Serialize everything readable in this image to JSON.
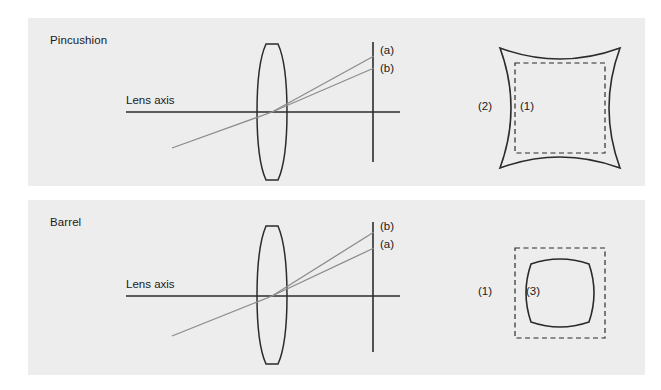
{
  "figure": {
    "background_color": "#ffffff",
    "panel_background_color": "#ededed",
    "line_color": "#2b2b2b",
    "ray_color": "#8c8c8c"
  },
  "panels": [
    {
      "id": "pincushion",
      "title": "Pincushion",
      "axis_label": "Lens axis",
      "ray_labels": {
        "upper": "(a)",
        "lower": "(b)"
      },
      "shape_labels": {
        "outer": "(2)",
        "inner": "(1)"
      },
      "distortion_shape": "concave-sided-square",
      "reference_shape": "dashed-square"
    },
    {
      "id": "barrel",
      "title": "Barrel",
      "axis_label": "Lens axis",
      "ray_labels": {
        "upper": "(b)",
        "lower": "(a)"
      },
      "shape_labels": {
        "outer": "(1)",
        "inner": "(3)"
      },
      "distortion_shape": "convex-sided-rounded-square",
      "reference_shape": "dashed-square"
    }
  ]
}
